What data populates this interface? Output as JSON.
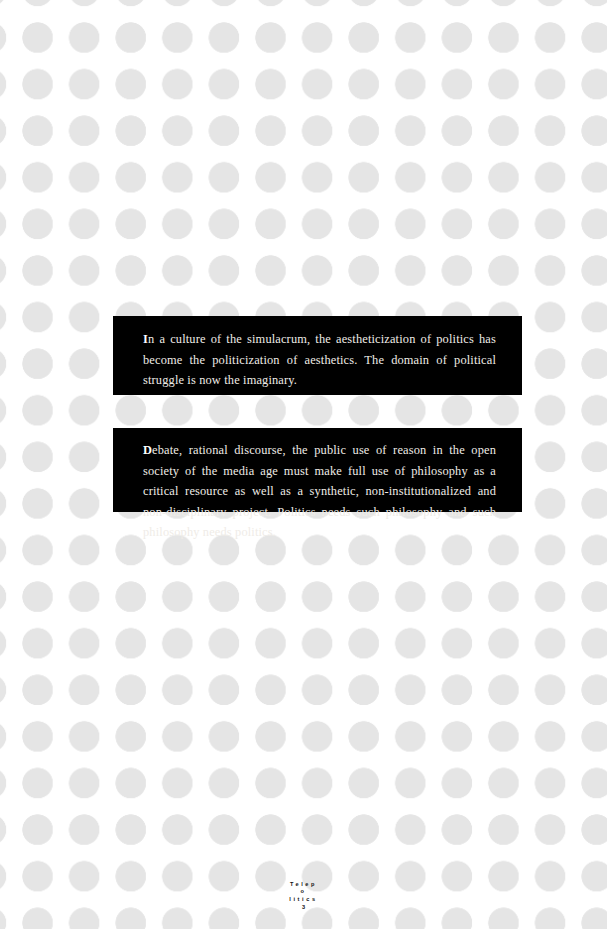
{
  "page": {
    "background_color": "#ffffff",
    "dot_color": "#e5e5e5",
    "panel_color": "#000000",
    "panel_text_color": "#efece7"
  },
  "quotes": [
    {
      "dropcap": "I",
      "rest": "n a culture of the simulacrum, the aestheticization of politics has become the politicization of aesthetics. The domain of political struggle is now the imaginary."
    },
    {
      "dropcap": "D",
      "rest": "ebate, rational discourse, the public use of reason in the open society of the media age must make full use of philosophy as a critical resource as well as a synthetic, non-institutionalized and non-disciplinary project. Politics needs such philosophy and such philosophy needs politics."
    }
  ],
  "footer": {
    "line1": "Telep",
    "line2": "o",
    "line3": "litics",
    "page_number": "3"
  }
}
